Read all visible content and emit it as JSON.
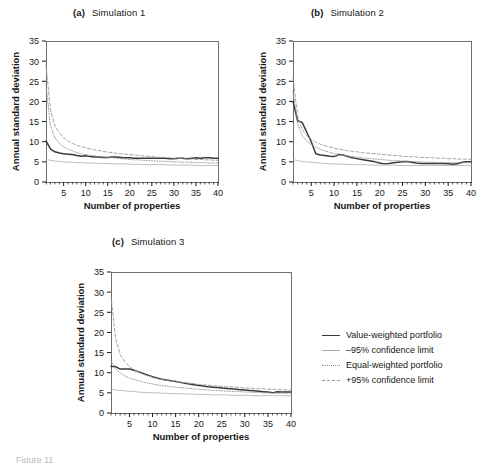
{
  "figure": {
    "background": "#ffffff",
    "ink": "#171717",
    "caption_fragment": "Figure 11"
  },
  "axis": {
    "xlabel": "Number of properties",
    "ylabel": "Annual standard deviation",
    "xticks": [
      5,
      10,
      15,
      20,
      25,
      30,
      35,
      40
    ],
    "yticks": [
      0,
      5,
      10,
      15,
      20,
      25,
      30,
      35
    ],
    "xlim": [
      1,
      40
    ],
    "ylim": [
      0,
      35
    ]
  },
  "legend": {
    "position": "right-of-panel-c",
    "items": [
      {
        "label": "Value-weighted portfolio",
        "style": "solid",
        "color": "#3a3a3a",
        "width": 1.6
      },
      {
        "label": "–95% confidence limit",
        "style": "solid",
        "color": "#a9a9a9",
        "width": 0.9
      },
      {
        "label": "Equal-weighted portfolio",
        "style": "dotted",
        "color": "#8d8d8d",
        "width": 0.9
      },
      {
        "label": "+95% confidence limit",
        "style": "dashed",
        "color": "#9a9a9a",
        "width": 0.9
      }
    ]
  },
  "panels": [
    {
      "tag": "(a)",
      "name": "Simulation 1"
    },
    {
      "tag": "(b)",
      "name": "Simulation 2"
    },
    {
      "tag": "(c)",
      "name": "Simulation 3"
    }
  ],
  "chart_data": [
    {
      "type": "line",
      "title": "(a)  Simulation 1",
      "xlabel": "Number of properties",
      "ylabel": "Annual standard deviation",
      "xlim": [
        1,
        40
      ],
      "ylim": [
        0,
        35
      ],
      "xticks": [
        5,
        10,
        15,
        20,
        25,
        30,
        35,
        40
      ],
      "yticks": [
        0,
        5,
        10,
        15,
        20,
        25,
        30,
        35
      ],
      "grid": false,
      "x": [
        1,
        2,
        3,
        4,
        5,
        6,
        7,
        8,
        9,
        10,
        11,
        12,
        13,
        14,
        15,
        16,
        17,
        18,
        19,
        20,
        21,
        22,
        23,
        24,
        25,
        26,
        27,
        28,
        29,
        30,
        31,
        32,
        33,
        34,
        35,
        36,
        37,
        38,
        39,
        40
      ],
      "series": [
        {
          "name": "Value-weighted portfolio",
          "style": "solid",
          "color": "#3a3a3a",
          "values": [
            10.2,
            8.2,
            7.5,
            7.2,
            7.0,
            6.9,
            6.8,
            6.6,
            6.4,
            6.5,
            6.3,
            6.2,
            6.2,
            6.1,
            6.1,
            6.2,
            6.2,
            6.1,
            6.0,
            6.0,
            5.9,
            5.9,
            5.9,
            5.9,
            5.9,
            5.9,
            5.9,
            5.9,
            5.8,
            5.8,
            5.9,
            5.9,
            5.8,
            5.9,
            6.0,
            5.9,
            6.0,
            6.0,
            5.9,
            5.9
          ]
        },
        {
          "name": "–95% confidence limit",
          "style": "solid",
          "color": "#b5b5b5",
          "values": [
            5.6,
            5.4,
            5.2,
            5.1,
            5.0,
            4.9,
            4.9,
            4.8,
            4.8,
            4.7,
            4.7,
            4.7,
            4.6,
            4.6,
            4.6,
            4.5,
            4.5,
            4.5,
            4.5,
            4.4,
            4.4,
            4.4,
            4.4,
            4.3,
            4.3,
            4.3,
            4.3,
            4.3,
            4.2,
            4.2,
            4.2,
            4.2,
            4.2,
            4.2,
            4.1,
            4.1,
            4.1,
            4.1,
            4.1,
            4.1
          ]
        },
        {
          "name": "Equal-weighted portfolio",
          "style": "dotted",
          "color": "#8d8d8d",
          "values": [
            24.0,
            14.0,
            11.0,
            9.6,
            8.7,
            8.1,
            7.7,
            7.3,
            7.0,
            6.8,
            6.6,
            6.5,
            6.3,
            6.2,
            6.1,
            6.0,
            5.9,
            5.8,
            5.7,
            5.6,
            5.5,
            5.5,
            5.4,
            5.3,
            5.3,
            5.2,
            5.2,
            5.1,
            5.1,
            5.0,
            5.0,
            4.9,
            4.9,
            4.9,
            4.8,
            4.8,
            4.8,
            4.7,
            4.7,
            4.7
          ]
        },
        {
          "name": "+95% confidence limit",
          "style": "dashed",
          "color": "#9a9a9a",
          "values": [
            29.0,
            18.0,
            14.0,
            12.2,
            11.0,
            10.2,
            9.6,
            9.1,
            8.8,
            8.5,
            8.2,
            8.0,
            7.8,
            7.6,
            7.4,
            7.3,
            7.1,
            7.0,
            6.9,
            6.8,
            6.7,
            6.6,
            6.5,
            6.4,
            6.3,
            6.2,
            6.1,
            6.1,
            6.0,
            5.9,
            5.9,
            5.8,
            5.7,
            5.7,
            5.6,
            5.6,
            5.5,
            5.5,
            5.4,
            5.4
          ]
        }
      ]
    },
    {
      "type": "line",
      "title": "(b)  Simulation 2",
      "xlabel": "Number of properties",
      "ylabel": "Annual standard deviation",
      "xlim": [
        1,
        40
      ],
      "ylim": [
        0,
        35
      ],
      "xticks": [
        5,
        10,
        15,
        20,
        25,
        30,
        35,
        40
      ],
      "yticks": [
        0,
        5,
        10,
        15,
        20,
        25,
        30,
        35
      ],
      "grid": false,
      "x": [
        1,
        2,
        3,
        4,
        5,
        6,
        7,
        8,
        9,
        10,
        11,
        12,
        13,
        14,
        15,
        16,
        17,
        18,
        19,
        20,
        21,
        22,
        23,
        24,
        25,
        26,
        27,
        28,
        29,
        30,
        31,
        32,
        33,
        34,
        35,
        36,
        37,
        38,
        39,
        40
      ],
      "series": [
        {
          "name": "Value-weighted portfolio",
          "style": "solid",
          "color": "#3a3a3a",
          "values": [
            20.0,
            15.2,
            14.8,
            12.4,
            10.0,
            7.0,
            6.7,
            6.6,
            6.4,
            6.3,
            6.8,
            6.7,
            6.3,
            6.0,
            5.8,
            5.6,
            5.4,
            5.2,
            5.0,
            4.7,
            4.5,
            4.6,
            4.8,
            4.9,
            5.0,
            5.1,
            4.9,
            4.7,
            4.6,
            4.6,
            4.6,
            4.6,
            4.6,
            4.6,
            4.5,
            4.4,
            4.5,
            4.9,
            5.0,
            5.0
          ]
        },
        {
          "name": "–95% confidence limit",
          "style": "solid",
          "color": "#b5b5b5",
          "values": [
            5.6,
            5.3,
            5.1,
            5.0,
            4.9,
            4.8,
            4.7,
            4.6,
            4.5,
            4.5,
            4.4,
            4.4,
            4.4,
            4.3,
            4.3,
            4.3,
            4.3,
            4.2,
            4.2,
            4.2,
            4.2,
            4.2,
            4.2,
            4.1,
            4.1,
            4.1,
            4.1,
            4.1,
            4.1,
            4.1,
            4.1,
            4.1,
            4.1,
            4.1,
            4.1,
            4.1,
            4.1,
            4.1,
            4.1,
            4.1
          ]
        },
        {
          "name": "Equal-weighted portfolio",
          "style": "dotted",
          "color": "#8d8d8d",
          "values": [
            22.5,
            14.5,
            11.5,
            10.2,
            9.3,
            8.6,
            8.1,
            7.7,
            7.4,
            7.1,
            6.9,
            6.7,
            6.5,
            6.3,
            6.2,
            6.0,
            5.9,
            5.8,
            5.7,
            5.6,
            5.5,
            5.4,
            5.3,
            5.3,
            5.2,
            5.1,
            5.1,
            5.0,
            5.0,
            4.9,
            4.9,
            4.9,
            4.8,
            4.8,
            4.8,
            4.8,
            4.8,
            4.8,
            4.8,
            4.8
          ]
        },
        {
          "name": "+95% confidence limit",
          "style": "dashed",
          "color": "#9a9a9a",
          "values": [
            26.0,
            16.5,
            13.0,
            11.5,
            10.6,
            9.9,
            9.4,
            9.0,
            8.7,
            8.4,
            8.2,
            8.0,
            7.8,
            7.6,
            7.5,
            7.3,
            7.2,
            7.1,
            7.0,
            6.9,
            6.8,
            6.7,
            6.6,
            6.5,
            6.4,
            6.3,
            6.3,
            6.2,
            6.1,
            6.1,
            6.0,
            6.0,
            5.9,
            5.9,
            5.8,
            5.8,
            5.7,
            5.7,
            5.7,
            5.6
          ]
        }
      ]
    },
    {
      "type": "line",
      "title": "(c)  Simulation 3",
      "xlabel": "Number of properties",
      "ylabel": "Annual standard deviation",
      "xlim": [
        1,
        40
      ],
      "ylim": [
        0,
        35
      ],
      "xticks": [
        5,
        10,
        15,
        20,
        25,
        30,
        35,
        40
      ],
      "yticks": [
        0,
        5,
        10,
        15,
        20,
        25,
        30,
        35
      ],
      "grid": false,
      "x": [
        1,
        2,
        3,
        4,
        5,
        6,
        7,
        8,
        9,
        10,
        11,
        12,
        13,
        14,
        15,
        16,
        17,
        18,
        19,
        20,
        21,
        22,
        23,
        24,
        25,
        26,
        27,
        28,
        29,
        30,
        31,
        32,
        33,
        34,
        35,
        36,
        37,
        38,
        39,
        40
      ],
      "series": [
        {
          "name": "Value-weighted portfolio",
          "style": "solid",
          "color": "#3a3a3a",
          "values": [
            11.6,
            11.5,
            10.9,
            10.9,
            10.9,
            10.6,
            10.2,
            9.8,
            9.4,
            9.0,
            8.7,
            8.4,
            8.2,
            8.0,
            7.8,
            7.6,
            7.4,
            7.2,
            7.0,
            6.8,
            6.7,
            6.5,
            6.4,
            6.3,
            6.2,
            6.1,
            6.0,
            5.9,
            5.8,
            5.7,
            5.6,
            5.5,
            5.4,
            5.3,
            5.2,
            5.0,
            5.3,
            5.2,
            5.2,
            5.2
          ]
        },
        {
          "name": "–95% confidence limit",
          "style": "solid",
          "color": "#b5b5b5",
          "values": [
            5.9,
            5.7,
            5.6,
            5.5,
            5.4,
            5.3,
            5.2,
            5.1,
            5.1,
            5.0,
            5.0,
            4.9,
            4.9,
            4.8,
            4.8,
            4.8,
            4.7,
            4.7,
            4.7,
            4.6,
            4.6,
            4.6,
            4.5,
            4.5,
            4.5,
            4.5,
            4.4,
            4.4,
            4.4,
            4.4,
            4.4,
            4.3,
            4.3,
            4.3,
            4.3,
            4.3,
            4.3,
            4.3,
            4.3,
            4.3
          ]
        },
        {
          "name": "Equal-weighted portfolio",
          "style": "dotted",
          "color": "#8d8d8d",
          "values": [
            13.0,
            11.0,
            9.9,
            9.2,
            8.7,
            8.3,
            8.0,
            7.7,
            7.4,
            7.2,
            7.0,
            6.8,
            6.7,
            6.5,
            6.4,
            6.3,
            6.2,
            6.1,
            6.0,
            5.9,
            5.8,
            5.7,
            5.6,
            5.6,
            5.5,
            5.4,
            5.4,
            5.3,
            5.3,
            5.2,
            5.2,
            5.1,
            5.1,
            5.0,
            5.0,
            5.0,
            4.9,
            4.9,
            4.9,
            4.9
          ]
        },
        {
          "name": "+95% confidence limit",
          "style": "dashed",
          "color": "#9a9a9a",
          "values": [
            29.0,
            18.5,
            14.5,
            12.7,
            11.5,
            10.7,
            10.1,
            9.6,
            9.2,
            8.9,
            8.6,
            8.4,
            8.2,
            8.0,
            7.8,
            7.7,
            7.5,
            7.4,
            7.3,
            7.1,
            7.0,
            6.9,
            6.8,
            6.7,
            6.6,
            6.5,
            6.5,
            6.4,
            6.3,
            6.2,
            6.2,
            6.1,
            6.0,
            6.0,
            5.9,
            5.9,
            5.8,
            5.8,
            5.7,
            5.7
          ]
        }
      ]
    }
  ]
}
